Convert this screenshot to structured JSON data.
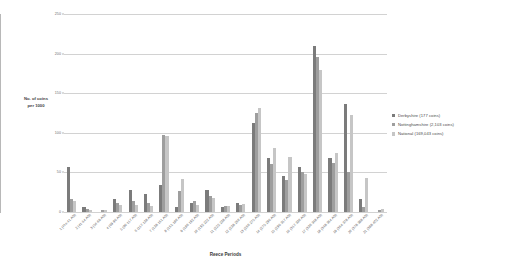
{
  "chart_data": {
    "type": "bar",
    "title": "",
    "xlabel": "Reece Periods",
    "ylabel": "No. of coins per 1000",
    "ylim": [
      0,
      250
    ],
    "yticks": [
      0,
      50,
      100,
      150,
      200,
      250
    ],
    "grid": true,
    "legend_position": "right",
    "categories": [
      "1 (Pre 41 AD)",
      "2 (41-54 AD)",
      "3 (54-69 AD)",
      "4 (69-96 AD)",
      "5 (96-117 AD)",
      "6 (117-138 AD)",
      "7 (138-161 AD)",
      "8 (161-180 AD)",
      "9 (180-192 AD)",
      "10 (192-222 AD)",
      "11 (222-238 AD)",
      "12 (238-260 AD)",
      "13 (260-275 AD)",
      "14 (275-296 AD)",
      "15 (296-317 AD)",
      "16 (317-330 AD)",
      "17 (330-348 AD)",
      "18 (348-364 AD)",
      "19 (364-378 AD)",
      "20 (378-388 AD)",
      "21 (388-402 AD)"
    ],
    "series": [
      {
        "name": "Derbyshire (177 coins)",
        "color": "#7b7b7b",
        "values": [
          57,
          6,
          0,
          17,
          28,
          23,
          34,
          6,
          11,
          28,
          6,
          11,
          113,
          68,
          45,
          57,
          210,
          68,
          136,
          17,
          0
        ]
      },
      {
        "name": "Nottinghamshire (2,103 coins)",
        "color": "#9e9e9e",
        "values": [
          17,
          4,
          3,
          12,
          14,
          12,
          97,
          27,
          14,
          20,
          8,
          9,
          125,
          61,
          40,
          51,
          196,
          62,
          50,
          6,
          2
        ]
      },
      {
        "name": "National (169,043 coins)",
        "color": "#c6c6c6",
        "values": [
          14,
          3,
          2,
          9,
          9,
          8,
          96,
          42,
          9,
          18,
          7,
          10,
          131,
          81,
          70,
          48,
          179,
          75,
          122,
          43,
          4
        ]
      }
    ]
  },
  "legend": {
    "items": [
      {
        "label": "Derbyshire (177 coins)",
        "color": "#7b7b7b"
      },
      {
        "label": "Nottinghamshire (2,103 coins)",
        "color": "#9e9e9e"
      },
      {
        "label": "National (169,043 coins)",
        "color": "#c6c6c6"
      }
    ]
  },
  "axes": {
    "y_title_line1": "No. of coins",
    "y_title_line2": "per 1000",
    "x_title": "Reece Periods"
  }
}
